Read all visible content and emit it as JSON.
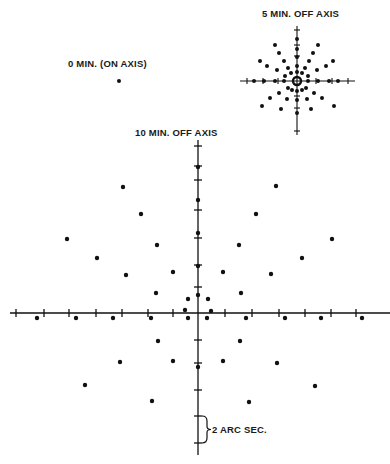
{
  "labels": {
    "five_min": "5 MIN. OFF AXIS",
    "zero_min": "0 MIN. (ON AXIS)",
    "ten_min": "10 MIN. OFF AXIS",
    "scale": "2 ARC SEC."
  },
  "colors": {
    "ink": "#111111",
    "background": "#ffffff"
  },
  "chart_data": {
    "type": "scatter",
    "panels": [
      {
        "name": "0 MIN. (ON AXIS)",
        "center": [
          119,
          81
        ],
        "points": [
          [
            119,
            81
          ]
        ]
      },
      {
        "name": "5 MIN. OFF AXIS",
        "center": [
          297,
          81
        ],
        "axis_x": [
          240,
          355
        ],
        "axis_y": [
          26,
          135
        ],
        "ticks_x": [
          247,
          263,
          278,
          316,
          332,
          348
        ],
        "ticks_y": [
          30,
          45,
          56,
          96,
          108,
          131
        ],
        "ring": [
          297,
          81,
          4
        ],
        "points": [
          [
            297,
            39
          ],
          [
            297,
            49
          ],
          [
            297,
            57
          ],
          [
            297,
            66
          ],
          [
            297,
            72
          ],
          [
            275,
            45
          ],
          [
            279,
            53
          ],
          [
            284,
            61
          ],
          [
            288,
            68
          ],
          [
            291,
            73
          ],
          [
            318,
            45
          ],
          [
            313,
            53
          ],
          [
            309,
            61
          ],
          [
            305,
            68
          ],
          [
            302,
            73
          ],
          [
            260,
            61
          ],
          [
            267,
            66
          ],
          [
            277,
            70
          ],
          [
            285,
            76
          ],
          [
            333,
            61
          ],
          [
            326,
            66
          ],
          [
            317,
            70
          ],
          [
            308,
            76
          ],
          [
            254,
            81
          ],
          [
            264,
            81
          ],
          [
            275,
            81
          ],
          [
            284,
            81
          ],
          [
            308,
            81
          ],
          [
            318,
            81
          ],
          [
            329,
            81
          ],
          [
            338,
            81
          ],
          [
            288,
            88
          ],
          [
            292,
            90
          ],
          [
            297,
            91
          ],
          [
            302,
            90
          ],
          [
            306,
            88
          ],
          [
            279,
            93
          ],
          [
            287,
            99
          ],
          [
            297,
            100
          ],
          [
            307,
            99
          ],
          [
            314,
            93
          ],
          [
            270,
            98
          ],
          [
            262,
            106
          ],
          [
            281,
            109
          ],
          [
            322,
            98
          ],
          [
            334,
            106
          ],
          [
            311,
            109
          ],
          [
            297,
            113
          ]
        ]
      },
      {
        "name": "10 MIN. OFF AXIS",
        "center": [
          198,
          313
        ],
        "axis_x": [
          10,
          390
        ],
        "axis_y": [
          140,
          455
        ],
        "ticks_x": [
          16,
          44,
          69,
          96,
          122,
          148,
          173,
          225,
          252,
          279,
          305,
          331,
          356
        ],
        "ticks_y": [
          146,
          166,
          180,
          210,
          238,
          265,
          287,
          340,
          363,
          390,
          416,
          443
        ],
        "points": [
          [
            198,
            167
          ],
          [
            198,
            200
          ],
          [
            198,
            233
          ],
          [
            198,
            266
          ],
          [
            198,
            295
          ],
          [
            123,
            187
          ],
          [
            141,
            214
          ],
          [
            157,
            245
          ],
          [
            173,
            272
          ],
          [
            188,
            299
          ],
          [
            276,
            186
          ],
          [
            256,
            214
          ],
          [
            239,
            245
          ],
          [
            223,
            272
          ],
          [
            208,
            299
          ],
          [
            67,
            239
          ],
          [
            97,
            258
          ],
          [
            126,
            275
          ],
          [
            156,
            293
          ],
          [
            332,
            239
          ],
          [
            302,
            258
          ],
          [
            271,
            274
          ],
          [
            241,
            293
          ],
          [
            185,
            310
          ],
          [
            211,
            311
          ],
          [
            37,
            318
          ],
          [
            76,
            318
          ],
          [
            113,
            318
          ],
          [
            151,
            318
          ],
          [
            188,
            318
          ],
          [
            207,
            318
          ],
          [
            246,
            318
          ],
          [
            285,
            318
          ],
          [
            321,
            318
          ],
          [
            362,
            318
          ],
          [
            158,
            341
          ],
          [
            173,
            361
          ],
          [
            198,
            367
          ],
          [
            223,
            361
          ],
          [
            240,
            341
          ],
          [
            120,
            362
          ],
          [
            85,
            385
          ],
          [
            152,
            401
          ],
          [
            277,
            363
          ],
          [
            315,
            386
          ],
          [
            249,
            402
          ]
        ],
        "scale_bar": {
          "label": "2 ARC SEC.",
          "from_y": 416,
          "to_y": 443,
          "x": 198
        }
      }
    ]
  }
}
